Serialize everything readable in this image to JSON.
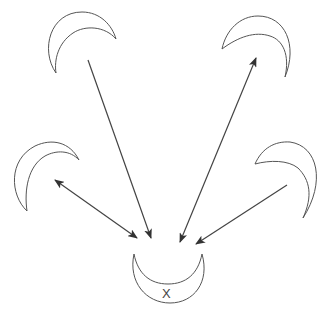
{
  "diagram": {
    "title": "",
    "center_label": "X",
    "nodes": [
      {
        "id": "top-left",
        "label": ""
      },
      {
        "id": "top-right",
        "label": ""
      },
      {
        "id": "left",
        "label": ""
      },
      {
        "id": "right",
        "label": ""
      },
      {
        "id": "center-bottom",
        "label": "X"
      }
    ],
    "edges": [
      {
        "from": "top-left",
        "to": "center-bottom",
        "direction": "to-center"
      },
      {
        "from": "center-bottom",
        "to": "top-right",
        "direction": "bidirectional"
      },
      {
        "from": "left",
        "to": "center-bottom",
        "direction": "bidirectional"
      },
      {
        "from": "right",
        "to": "center-bottom",
        "direction": "to-center"
      }
    ],
    "colors": {
      "stroke": "#555555",
      "arrow": "#444444",
      "background": "#ffffff"
    }
  }
}
